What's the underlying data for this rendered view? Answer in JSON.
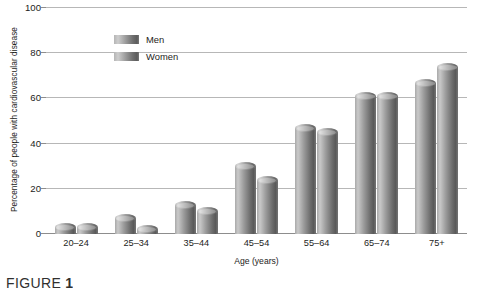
{
  "chart_data": {
    "type": "bar",
    "title": "",
    "xlabel": "Age (years)",
    "ylabel": "Percentage of people with cardiovascular disease",
    "categories": [
      "20–24",
      "25–34",
      "35–44",
      "45–54",
      "55–64",
      "65–74",
      "75+"
    ],
    "series": [
      {
        "name": "Men",
        "values": [
          3,
          7,
          13,
          30,
          47,
          61,
          67
        ]
      },
      {
        "name": "Women",
        "values": [
          3,
          2,
          10,
          24,
          45,
          61,
          74
        ]
      }
    ],
    "ylim": [
      0,
      100
    ],
    "yticks": [
      0,
      20,
      40,
      60,
      80,
      100
    ],
    "ytick_labels": [
      "0",
      "20",
      "40",
      "60",
      "80",
      "100"
    ],
    "grid": true,
    "legend_position": "top-left",
    "bar_style": "3d-cylinder-grayscale"
  },
  "legend": {
    "items": [
      {
        "label": "Men"
      },
      {
        "label": "Women"
      }
    ]
  },
  "caption": {
    "prefix": "FIGURE",
    "number": "1"
  },
  "colors": {
    "gridline": "#b7b7b7",
    "axis": "#8d8d8d",
    "bar_light": "#cdcdcd",
    "bar_dark": "#5a5a5a",
    "text": "#1d1d1b",
    "background": "#ffffff"
  }
}
